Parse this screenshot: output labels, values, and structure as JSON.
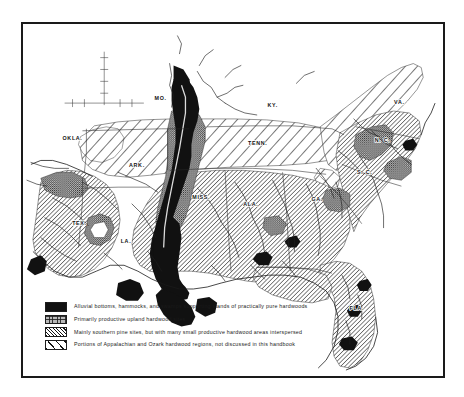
{
  "figure": {
    "type": "thematic-map",
    "region": "Southern United States",
    "border_color": "#1a1a1a",
    "background_color": "#ffffff"
  },
  "map": {
    "state_labels": [
      {
        "id": "mo",
        "text": "MO.",
        "x": 139,
        "y": 77
      },
      {
        "id": "ky",
        "text": "KY.",
        "x": 252,
        "y": 84
      },
      {
        "id": "okla",
        "text": "OKLA.",
        "x": 50,
        "y": 117
      },
      {
        "id": "tenn",
        "text": "TENN.",
        "x": 237,
        "y": 122
      },
      {
        "id": "ark",
        "text": "ARK.",
        "x": 115,
        "y": 145
      },
      {
        "id": "va",
        "text": "VA.",
        "x": 380,
        "y": 81
      },
      {
        "id": "nc",
        "text": "N. C.",
        "x": 363,
        "y": 119
      },
      {
        "id": "sc",
        "text": "S. C.",
        "x": 345,
        "y": 152
      },
      {
        "id": "miss",
        "text": "MISS.",
        "x": 180,
        "y": 177
      },
      {
        "id": "ala",
        "text": "ALA.",
        "x": 230,
        "y": 184
      },
      {
        "id": "ga",
        "text": "GA.",
        "x": 297,
        "y": 179
      },
      {
        "id": "tex",
        "text": "TEX.",
        "x": 57,
        "y": 203
      },
      {
        "id": "la",
        "text": "LA.",
        "x": 104,
        "y": 221
      },
      {
        "id": "fla",
        "text": "FLA.",
        "x": 337,
        "y": 289
      }
    ]
  },
  "legend": {
    "items": [
      {
        "id": "alluvial",
        "swatch": "solid-black",
        "color": "#111111",
        "text": "Alluvial bottoms, hammocks, and swamps supporting stands of practically pure hardwoods"
      },
      {
        "id": "upland",
        "swatch": "gray-stipple",
        "color": "#b9b9b9",
        "text": "Primarily productive upland hardwood sites"
      },
      {
        "id": "pine",
        "swatch": "dense-diagonal-hatch",
        "color": "#141414",
        "text": "Mainly southern pine sites, but with many small productive hardwood areas interspersed"
      },
      {
        "id": "appalachian",
        "swatch": "sparse-diagonal-hatch",
        "color": "#141414",
        "text": "Portions of Appalachian and Ozark hardwood regions, not discussed in this handbook"
      }
    ]
  }
}
